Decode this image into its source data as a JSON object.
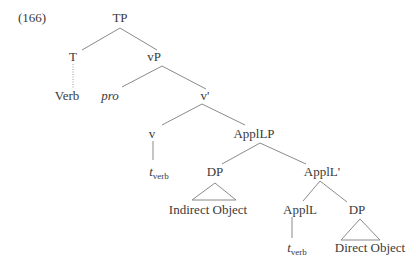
{
  "example_number": "(166)",
  "nodes": {
    "tp": "TP",
    "t": "T",
    "verb": "Verb",
    "vp": "vP",
    "pro": "pro",
    "v_bar": "v'",
    "v": "v",
    "t_verb_1": {
      "base": "t",
      "sub": "verb"
    },
    "appllp": "ApplLP",
    "dp_indirect": "DP",
    "indirect_object": "Indirect Object",
    "appll_bar": "ApplL'",
    "appll": "ApplL",
    "t_verb_2": {
      "base": "t",
      "sub": "verb"
    },
    "dp_direct": "DP",
    "direct_object": "Direct Object"
  },
  "colors": {
    "text": "#3a3a3a",
    "edge": "#8a8a8a",
    "background": "#ffffff"
  }
}
